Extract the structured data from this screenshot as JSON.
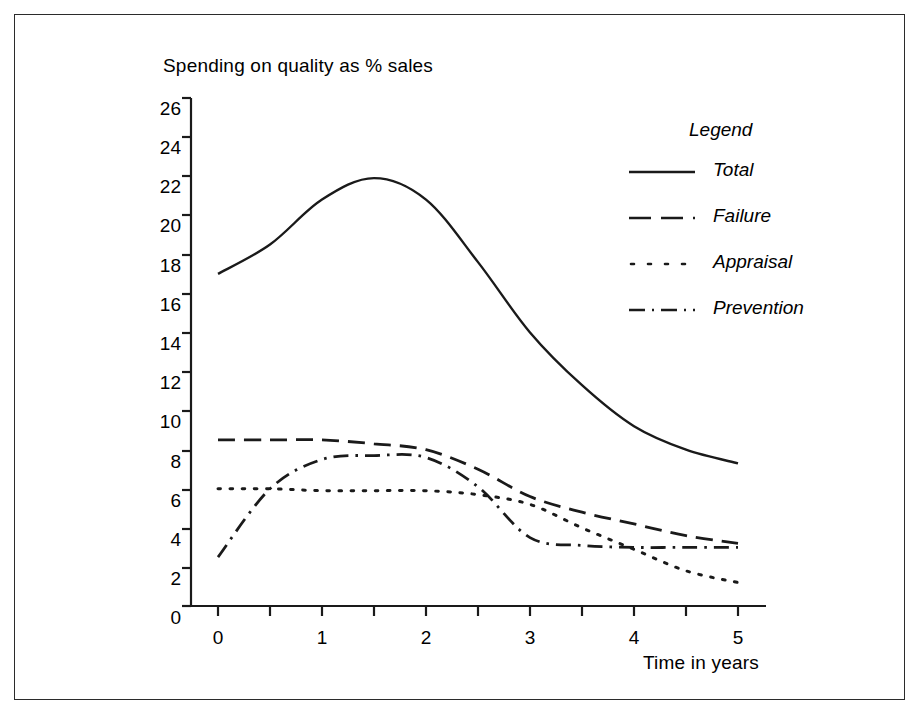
{
  "chart_data": {
    "type": "line",
    "title": "Spending on quality as % sales",
    "xlabel": "Time in years",
    "ylabel": "",
    "xlim": [
      0,
      5
    ],
    "ylim": [
      0,
      26
    ],
    "xticks": [
      0,
      1,
      2,
      3,
      4,
      5
    ],
    "xtick_labels": [
      "0",
      "1",
      "2",
      "3",
      "4",
      "5"
    ],
    "xminor_step": 0.5,
    "yticks": [
      0,
      2,
      4,
      6,
      8,
      10,
      12,
      14,
      16,
      18,
      20,
      22,
      24,
      26
    ],
    "ytick_labels": [
      "0",
      "2",
      "4",
      "6",
      "8",
      "10",
      "12",
      "14",
      "16",
      "18",
      "20",
      "22",
      "24",
      "26"
    ],
    "grid": false,
    "legend_title": "Legend",
    "legend_position": "upper right inside",
    "line_color": "#1a1a1a",
    "x": [
      0,
      0.5,
      1,
      1.5,
      2,
      2.5,
      3,
      3.5,
      4,
      4.5,
      5
    ],
    "series": [
      {
        "name": "Total",
        "style": "solid",
        "values": [
          17.0,
          18.5,
          20.8,
          21.9,
          20.8,
          17.6,
          14.0,
          11.3,
          9.2,
          8.0,
          7.3
        ]
      },
      {
        "name": "Failure",
        "style": "dashed",
        "values": [
          8.5,
          8.5,
          8.5,
          8.3,
          8.0,
          7.0,
          5.6,
          4.8,
          4.2,
          3.6,
          3.2
        ]
      },
      {
        "name": "Appraisal",
        "style": "dotted",
        "values": [
          6.0,
          6.0,
          5.9,
          5.9,
          5.9,
          5.7,
          5.2,
          4.0,
          2.9,
          1.8,
          1.2
        ]
      },
      {
        "name": "Prevention",
        "style": "dashdot",
        "values": [
          2.5,
          6.0,
          7.5,
          7.7,
          7.6,
          6.1,
          3.5,
          3.1,
          3.0,
          3.0,
          3.0
        ]
      }
    ]
  },
  "legend": {
    "title": "Legend",
    "items": [
      {
        "label": "Total",
        "swatch": "solid-line-swatch"
      },
      {
        "label": "Failure",
        "swatch": "dashed-line-swatch"
      },
      {
        "label": "Appraisal",
        "swatch": "dotted-line-swatch"
      },
      {
        "label": "Prevention",
        "swatch": "dashdot-line-swatch"
      }
    ]
  },
  "axes": {
    "title": "Spending on quality as % sales",
    "xlabel": "Time in years",
    "ytick_labels": [
      "26",
      "24",
      "22",
      "20",
      "18",
      "16",
      "14",
      "12",
      "10",
      "8",
      "6",
      "4",
      "2",
      "0"
    ],
    "xtick_labels": [
      "0",
      "1",
      "2",
      "3",
      "4",
      "5"
    ]
  }
}
